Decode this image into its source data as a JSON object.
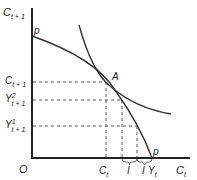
{
  "diagram": {
    "y_axis_label": {
      "main": "C",
      "sub": "t + 1"
    },
    "x_axis_label": {
      "main": "C",
      "sub": "t"
    },
    "origin_label": "O",
    "curve_label_top": "p",
    "curve_label_bottom": "p",
    "tangent_point_label": "A",
    "y_ticks": [
      {
        "main": "C",
        "sup": "",
        "sub": "t + 1"
      },
      {
        "main": "Y",
        "sup": "2",
        "sub": "t + 1"
      },
      {
        "main": "Y",
        "sup": "1",
        "sub": "t + 1"
      }
    ],
    "x_ticks": [
      {
        "main": "C",
        "sub": "t"
      },
      {
        "main": "I",
        "sub": ""
      },
      {
        "main": "I",
        "sub": ""
      },
      {
        "main": "Y",
        "sub": "t"
      }
    ],
    "curves": [
      {
        "name": "production-possibility-curve",
        "label": "pp"
      },
      {
        "name": "indifference-curve",
        "label": ""
      }
    ]
  }
}
